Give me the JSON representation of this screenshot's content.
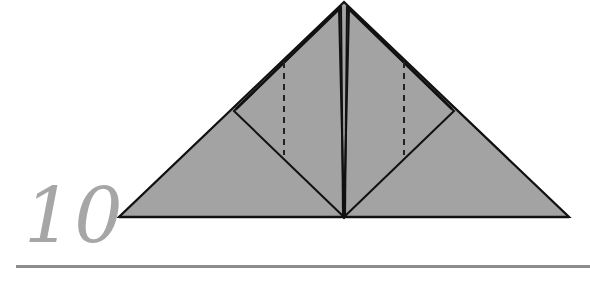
{
  "step": {
    "number": "10"
  },
  "colors": {
    "paper_fill": "#a3a3a3",
    "line": "#111111",
    "step_number": "#a6a6a6",
    "rule": "#8c8c8c"
  },
  "diagram": {
    "outer_triangle": {
      "apex": [
        344,
        2
      ],
      "base_left": [
        119,
        217
      ],
      "base_right": [
        569,
        217
      ]
    },
    "center_line": {
      "from": [
        344,
        4
      ],
      "to": [
        344,
        217
      ]
    },
    "left_flap": {
      "points": [
        [
          338,
          8
        ],
        [
          234,
          111
        ],
        [
          344,
          217
        ]
      ]
    },
    "right_flap": {
      "points": [
        [
          350,
          8
        ],
        [
          454,
          111
        ],
        [
          344,
          217
        ]
      ]
    },
    "valley_folds": [
      {
        "name": "left-dashed-fold",
        "from": [
          284,
          62
        ],
        "to": [
          284,
          155
        ]
      },
      {
        "name": "right-dashed-fold",
        "from": [
          404,
          62
        ],
        "to": [
          404,
          155
        ]
      }
    ]
  }
}
